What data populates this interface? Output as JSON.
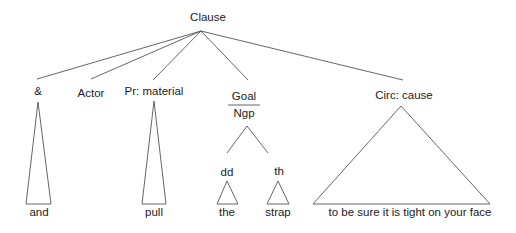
{
  "diagram": {
    "type": "syntax-tree",
    "root": {
      "label": "Clause"
    },
    "constituents": [
      {
        "label": "&",
        "words": "and"
      },
      {
        "label": "Actor",
        "words": ""
      },
      {
        "label": "Pr: material",
        "words": "pull"
      },
      {
        "label": "Goal",
        "sublabel": "Ngp",
        "children": [
          {
            "label": "dd",
            "words": "the"
          },
          {
            "label": "th",
            "words": "strap"
          }
        ]
      },
      {
        "label": "Circ: cause",
        "words": "to be sure it is tight on your face"
      }
    ],
    "colors": {
      "line": "#555555",
      "text": "#222222",
      "background": "#ffffff"
    }
  }
}
